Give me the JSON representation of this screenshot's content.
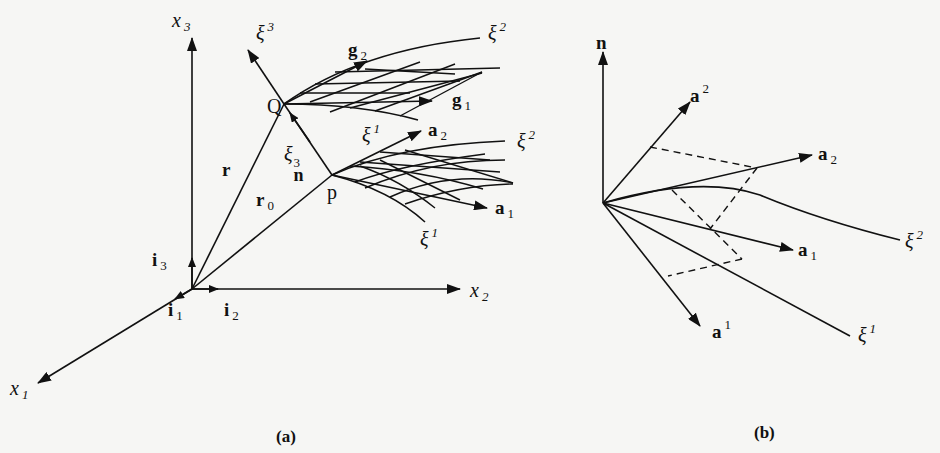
{
  "figure": {
    "panel_a": {
      "caption": "(a)",
      "axes": {
        "x1": {
          "base": "x",
          "index": "1"
        },
        "x2": {
          "base": "x",
          "index": "2"
        },
        "x3": {
          "base": "x",
          "index": "3"
        }
      },
      "unit_vectors": {
        "i1": {
          "base": "i",
          "index": "1"
        },
        "i2": {
          "base": "i",
          "index": "2"
        },
        "i3": {
          "base": "i",
          "index": "3"
        }
      },
      "position_vectors": {
        "r": "r",
        "r0": {
          "base": "r",
          "index": "0"
        }
      },
      "points": {
        "Q": "Q",
        "p": "p"
      },
      "normal_label": {
        "base": "ξ",
        "sup": "3",
        "sub": "n"
      },
      "coordinate_lines": {
        "xi3_upper": {
          "base": "ξ",
          "index": "3"
        },
        "xi2_upper": {
          "base": "ξ",
          "index": "2"
        },
        "xi1_upper": {
          "base": "ξ",
          "index": "1"
        },
        "xi2_lower": {
          "base": "ξ",
          "index": "2"
        },
        "xi1_lower": {
          "base": "ξ",
          "index": "1"
        }
      },
      "base_vectors": {
        "g1": {
          "base": "g",
          "index": "1"
        },
        "g2": {
          "base": "g",
          "index": "2"
        },
        "a1": {
          "base": "a",
          "index": "1"
        },
        "a2": {
          "base": "a",
          "index": "2"
        }
      }
    },
    "panel_b": {
      "caption": "(b)",
      "normal": "n",
      "covariant": {
        "a1": {
          "base": "a",
          "index": "1"
        },
        "a2": {
          "base": "a",
          "index": "2"
        }
      },
      "contravariant": {
        "a_sup1": {
          "base": "a",
          "index": "1"
        },
        "a_sup2": {
          "base": "a",
          "index": "2"
        }
      },
      "coordinate_lines": {
        "xi1": {
          "base": "ξ",
          "index": "1"
        },
        "xi2": {
          "base": "ξ",
          "index": "2"
        }
      }
    }
  }
}
